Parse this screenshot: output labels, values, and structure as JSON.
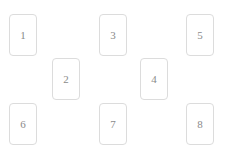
{
  "surface": {
    "background_color": "#ffffff",
    "width": 226,
    "height": 153
  },
  "card_style": {
    "background_color": "#ffffff",
    "border_color": "#dcdcdc",
    "label_color": "#8a8a8a",
    "width": 28,
    "height": 42,
    "corner_radius": 4
  },
  "cards": [
    {
      "label": "1",
      "x": 9,
      "y": 14,
      "row": "top"
    },
    {
      "label": "2",
      "x": 52,
      "y": 58,
      "row": "middle"
    },
    {
      "label": "3",
      "x": 99,
      "y": 14,
      "row": "top"
    },
    {
      "label": "4",
      "x": 140,
      "y": 58,
      "row": "middle"
    },
    {
      "label": "5",
      "x": 186,
      "y": 14,
      "row": "top"
    },
    {
      "label": "6",
      "x": 9,
      "y": 103,
      "row": "bottom"
    },
    {
      "label": "7",
      "x": 99,
      "y": 103,
      "row": "bottom"
    },
    {
      "label": "8",
      "x": 186,
      "y": 103,
      "row": "bottom"
    }
  ]
}
